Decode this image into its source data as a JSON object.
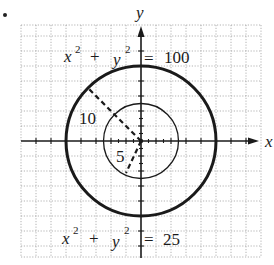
{
  "figure": {
    "bullet": "•",
    "axes": {
      "x_label": "x",
      "y_label": "y",
      "origin_px": [
        141,
        141
      ],
      "px_per_unit": 7.5,
      "grid_spacing_units": 2,
      "x_range": [
        -16,
        16
      ],
      "y_range": [
        -16,
        16
      ]
    },
    "circles": [
      {
        "name": "outer",
        "equation": "x² + y² = 100",
        "radius": 10,
        "stroke_width": 3,
        "radius_label": "10"
      },
      {
        "name": "inner",
        "equation": "x² + y² = 25",
        "radius": 5,
        "stroke_width": 1.3,
        "radius_label": "5"
      }
    ],
    "labels": {
      "outer_eq": {
        "lhs_x": "x",
        "lhs_x_exp": "2",
        "plus": "+",
        "lhs_y": "y",
        "lhs_y_exp": "2",
        "eq": "=",
        "rhs": "100"
      },
      "inner_eq": {
        "lhs_x": "x",
        "lhs_x_exp": "2",
        "plus": "+",
        "lhs_y": "y",
        "lhs_y_exp": "2",
        "eq": "=",
        "rhs": "25"
      },
      "outer_radius": "10",
      "inner_radius": "5"
    },
    "colors": {
      "ink": "#1a1a1a",
      "grid": "#9a9a9a",
      "background": "#ffffff"
    }
  }
}
